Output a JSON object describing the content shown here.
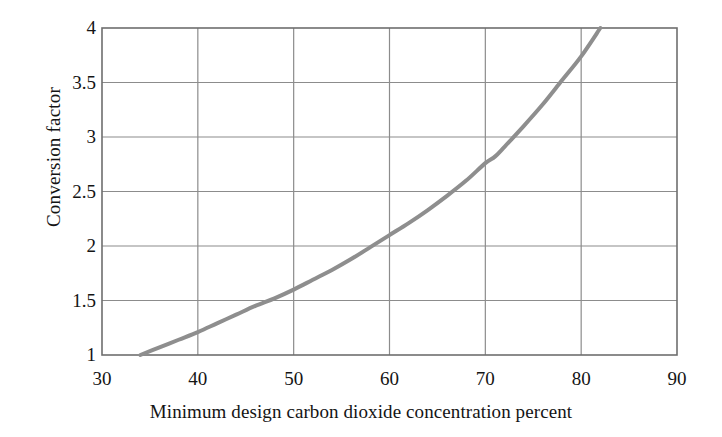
{
  "chart_data": {
    "type": "line",
    "title": "",
    "subtitle": "",
    "xlabel": "Minimum design carbon dioxide concentration percent",
    "ylabel": "Conversion factor",
    "xlim": [
      30,
      90
    ],
    "ylim": [
      1,
      4
    ],
    "xticks": [
      30,
      40,
      50,
      60,
      70,
      80,
      90
    ],
    "yticks": [
      1,
      1.5,
      2,
      2.5,
      3,
      3.5,
      4
    ],
    "xtick_labels": [
      "30",
      "40",
      "50",
      "60",
      "70",
      "80",
      "90"
    ],
    "ytick_labels": [
      "1",
      "1.5",
      "2",
      "2.5",
      "3",
      "3.5",
      "4"
    ],
    "grid": true,
    "grid_color": "#8c8c8c",
    "legend": null,
    "series": [
      {
        "name": "Conversion factor",
        "color": "#8e8e8e",
        "line_width": 4,
        "x": [
          34,
          36,
          38,
          40,
          42,
          44,
          46,
          48,
          50,
          52,
          54,
          56,
          58,
          60,
          62,
          64,
          66,
          68,
          70,
          71,
          72,
          74,
          76,
          78,
          80,
          82
        ],
        "y": [
          1.0,
          1.07,
          1.14,
          1.21,
          1.29,
          1.37,
          1.45,
          1.52,
          1.6,
          1.69,
          1.78,
          1.88,
          1.99,
          2.1,
          2.21,
          2.33,
          2.46,
          2.6,
          2.76,
          2.82,
          2.91,
          3.1,
          3.3,
          3.52,
          3.74,
          4.0
        ]
      }
    ]
  },
  "axes": {
    "frame_color": "#6e6e6e",
    "plot_left": 102,
    "plot_right": 677,
    "plot_top": 28,
    "plot_bottom": 355
  }
}
